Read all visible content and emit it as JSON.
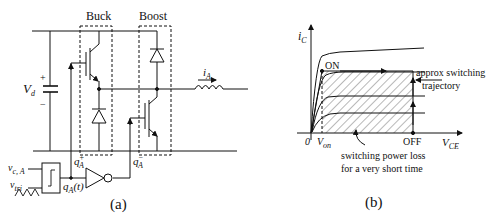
{
  "figure_a": {
    "caption": "(a)",
    "buck_label": "Buck",
    "boost_label": "Boost",
    "source_label": "V",
    "source_sub": "d",
    "plus": "+",
    "minus": "−",
    "current_label": "i",
    "current_sub": "A",
    "gate_plus_label": "q",
    "gate_plus_sub": "A",
    "gate_plus_sup": "+",
    "gate_minus_label": "q",
    "gate_minus_sub": "A",
    "gate_minus_sup": "−",
    "control_label": "v",
    "control_sub": "c, A",
    "tri_label": "v",
    "tri_sub": "tri",
    "switch_fn_label": "q",
    "switch_fn_sub": "A",
    "switch_fn_arg": "(t)"
  },
  "figure_b": {
    "caption": "(b)",
    "y_axis_label": "i",
    "y_axis_sub": "C",
    "x_axis_label": "V",
    "x_axis_sub": "CE",
    "origin_label": "0",
    "von_label": "V",
    "von_sub": "on",
    "on_label": "ON",
    "off_label": "OFF",
    "trajectory_label_line1": "approx switching",
    "trajectory_label_line2": "trajectory",
    "loss_label_line1": "switching power loss",
    "loss_label_line2": "for a very short time"
  }
}
